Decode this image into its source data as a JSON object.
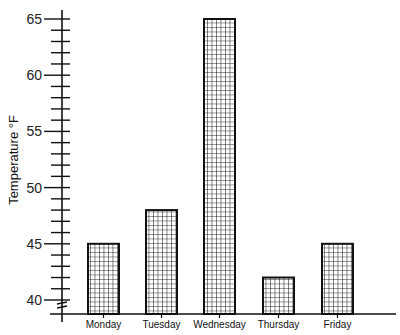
{
  "chart_data": {
    "type": "bar",
    "title": "",
    "xlabel": "",
    "ylabel": "Temperature °F",
    "categories": [
      "Monday",
      "Tuesday",
      "Wednesday",
      "Thursday",
      "Friday"
    ],
    "values": [
      45,
      48,
      65,
      42,
      45
    ],
    "ylim": [
      38.7,
      66
    ],
    "y_ticks_major": [
      40,
      45,
      50,
      55,
      60,
      65
    ],
    "y_minor_step": 1,
    "axis_break": true,
    "bar_pattern": "grid-hatch",
    "grid": false,
    "legend": null
  },
  "colors": {
    "axis": "#111111",
    "bar_border": "#111111",
    "hatch": "#222222",
    "background": "#ffffff"
  }
}
